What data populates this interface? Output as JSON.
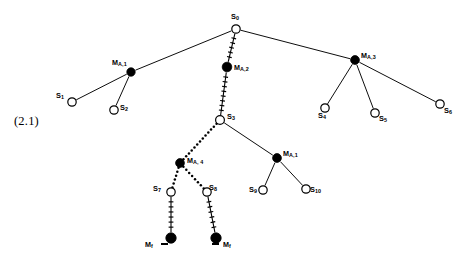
{
  "figure": {
    "equation_number": "(2.1)",
    "width": 462,
    "height": 259,
    "background_color": "#ffffff",
    "stroke_color": "#000000",
    "type": "tree-diagram"
  },
  "nodes": [
    {
      "id": "S0",
      "label": "S",
      "sub": "0",
      "x": 236,
      "y": 29,
      "style": "open",
      "r": 4.2,
      "label_x": 231,
      "label_y": 13,
      "label_align": "left"
    },
    {
      "id": "MA1a",
      "label": "M",
      "sub": "A,1",
      "x": 131,
      "y": 72,
      "style": "filled",
      "r": 4.2,
      "label_x": 112,
      "label_y": 59,
      "label_align": "left"
    },
    {
      "id": "S1",
      "label": "S",
      "sub": "1",
      "x": 72,
      "y": 102,
      "style": "open",
      "r": 4.2,
      "label_x": 56,
      "label_y": 92,
      "label_align": "left"
    },
    {
      "id": "S2",
      "label": "S",
      "sub": "2",
      "x": 114,
      "y": 110,
      "style": "open",
      "r": 4.2,
      "label_x": 120,
      "label_y": 104,
      "label_align": "left"
    },
    {
      "id": "MA2",
      "label": "M",
      "sub": "A,2",
      "x": 227,
      "y": 67,
      "style": "filled",
      "r": 4.8,
      "label_x": 234,
      "label_y": 64,
      "label_align": "left"
    },
    {
      "id": "MA3",
      "label": "M",
      "sub": "A,3",
      "x": 355,
      "y": 60,
      "style": "filled",
      "r": 4.4,
      "label_x": 361,
      "label_y": 52,
      "label_align": "left"
    },
    {
      "id": "S4",
      "label": "S",
      "sub": "4",
      "x": 325,
      "y": 108,
      "style": "open",
      "r": 4.2,
      "label_x": 318,
      "label_y": 112,
      "label_align": "left"
    },
    {
      "id": "S5",
      "label": "S",
      "sub": "5",
      "x": 375,
      "y": 113,
      "style": "open",
      "r": 4.2,
      "label_x": 379,
      "label_y": 115,
      "label_align": "left"
    },
    {
      "id": "S6",
      "label": "S",
      "sub": "6",
      "x": 440,
      "y": 104,
      "style": "open",
      "r": 4.2,
      "label_x": 444,
      "label_y": 107,
      "label_align": "left"
    },
    {
      "id": "S3",
      "label": "S",
      "sub": "3",
      "x": 220,
      "y": 120,
      "style": "open",
      "r": 4.4,
      "label_x": 227,
      "label_y": 113,
      "label_align": "left"
    },
    {
      "id": "MA4",
      "label": "M",
      "sub": "A, 4",
      "x": 180,
      "y": 163,
      "style": "filled",
      "r": 4.4,
      "label_x": 187,
      "label_y": 157,
      "label_align": "left"
    },
    {
      "id": "S7",
      "label": "S",
      "sub": "7",
      "x": 171,
      "y": 192,
      "style": "open",
      "r": 4.2,
      "label_x": 153,
      "label_y": 185,
      "label_align": "left"
    },
    {
      "id": "S8",
      "label": "S",
      "sub": "8",
      "x": 207,
      "y": 192,
      "style": "open",
      "r": 4.2,
      "label_x": 209,
      "label_y": 184,
      "label_align": "left"
    },
    {
      "id": "MA1b",
      "label": "M",
      "sub": "A,1",
      "x": 277,
      "y": 158,
      "style": "filled",
      "r": 4.4,
      "label_x": 283,
      "label_y": 150,
      "label_align": "left"
    },
    {
      "id": "S9",
      "label": "S",
      "sub": "9",
      "x": 263,
      "y": 190,
      "style": "open",
      "r": 4.2,
      "label_x": 249,
      "label_y": 186,
      "label_align": "left"
    },
    {
      "id": "S10",
      "label": "S",
      "sub": "10",
      "x": 306,
      "y": 189,
      "style": "open",
      "r": 4.2,
      "label_x": 310,
      "label_y": 186,
      "label_align": "left"
    },
    {
      "id": "Mf1",
      "label": "M",
      "sub": "f",
      "x": 171,
      "y": 238,
      "style": "filled",
      "r": 5.2,
      "label_x": 145,
      "label_y": 241,
      "label_align": "left"
    },
    {
      "id": "Mf2",
      "label": "M",
      "sub": "f",
      "x": 216,
      "y": 238,
      "style": "filled",
      "r": 5.2,
      "label_x": 223,
      "label_y": 241,
      "label_align": "left"
    }
  ],
  "dashes": [
    {
      "id": "dash-left",
      "x": 161,
      "y": 243
    },
    {
      "id": "dash-right",
      "x": 212,
      "y": 243
    }
  ],
  "edges": [
    {
      "id": "S0-MA1a",
      "from": "S0",
      "to": "MA1a",
      "style": "solid"
    },
    {
      "id": "MA1a-S1",
      "from": "MA1a",
      "to": "S1",
      "style": "solid"
    },
    {
      "id": "MA1a-S2",
      "from": "MA1a",
      "to": "S2",
      "style": "solid"
    },
    {
      "id": "S0-MA2",
      "from": "S0",
      "to": "MA2",
      "style": "hatch"
    },
    {
      "id": "MA2-S3",
      "from": "MA2",
      "to": "S3",
      "style": "hatch"
    },
    {
      "id": "S0-MA3",
      "from": "S0",
      "to": "MA3",
      "style": "solid"
    },
    {
      "id": "MA3-S4",
      "from": "MA3",
      "to": "S4",
      "style": "solid"
    },
    {
      "id": "MA3-S5",
      "from": "MA3",
      "to": "S5",
      "style": "solid"
    },
    {
      "id": "MA3-S6",
      "from": "MA3",
      "to": "S6",
      "style": "solid"
    },
    {
      "id": "S3-MA4",
      "from": "S3",
      "to": "MA4",
      "style": "dotted"
    },
    {
      "id": "MA4-S7",
      "from": "MA4",
      "to": "S7",
      "style": "dotted"
    },
    {
      "id": "MA4-S8",
      "from": "MA4",
      "to": "S8",
      "style": "dotted"
    },
    {
      "id": "S3-MA1b",
      "from": "S3",
      "to": "MA1b",
      "style": "solid"
    },
    {
      "id": "MA1b-S9",
      "from": "MA1b",
      "to": "S9",
      "style": "solid"
    },
    {
      "id": "MA1b-S10",
      "from": "MA1b",
      "to": "S10",
      "style": "solid"
    },
    {
      "id": "S7-Mf1",
      "from": "S7",
      "to": "Mf1",
      "style": "hatch"
    },
    {
      "id": "S8-Mf2",
      "from": "S8",
      "to": "Mf2",
      "style": "hatch"
    }
  ]
}
